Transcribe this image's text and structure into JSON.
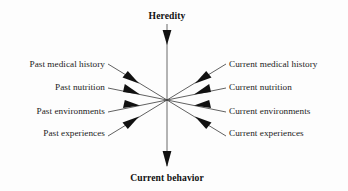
{
  "diagram": {
    "title_top": "Heredity",
    "title_bottom": "Current behavior",
    "center": {
      "x": 167,
      "y": 100
    },
    "colors": {
      "background": "#fdfdfd",
      "text": "#1c1c1c",
      "line": "#3a3a3a",
      "axis_line": "#6a6a6a",
      "arrow": "#111111"
    },
    "left_inputs": [
      {
        "label": "Past medical history",
        "y": 65
      },
      {
        "label": "Past nutrition",
        "y": 88
      },
      {
        "label": "Past environments",
        "y": 112
      },
      {
        "label": "Past experiences",
        "y": 134
      }
    ],
    "right_inputs": [
      {
        "label": "Current medical history",
        "y": 65
      },
      {
        "label": "Current nutrition",
        "y": 88
      },
      {
        "label": "Current environments",
        "y": 112
      },
      {
        "label": "Current experiences",
        "y": 134
      }
    ],
    "vertical_axis": {
      "top_label": "Heredity",
      "bottom_label": "Current behavior",
      "top_label_y": 15,
      "bottom_label_y": 177,
      "line_start_y": 24,
      "line_end_y": 166
    }
  }
}
